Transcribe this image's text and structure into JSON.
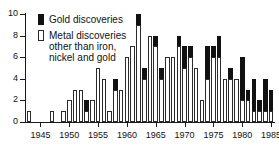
{
  "legend": {
    "gold_label": "Gold discoveries",
    "metal_label": "Metal discoveries\nother than iron,\nnickel and gold"
  },
  "axis": {
    "y_ticks": [
      "0",
      "2",
      "4",
      "6",
      "8",
      "10"
    ],
    "x_ticks": [
      "1945",
      "1950",
      "1955",
      "1960",
      "1965",
      "1970",
      "1975",
      "1980",
      "1985"
    ]
  },
  "colors": {
    "gold": "#111111",
    "metal": "#ffffff",
    "outline": "#2b2b2b",
    "axis": "#1a1a1a",
    "background": "#ffffff"
  },
  "chart_data": {
    "type": "bar",
    "title": "",
    "xlabel": "",
    "ylabel": "",
    "stacked": true,
    "grid": false,
    "legend_position": "top-left",
    "ylim": [
      0,
      10
    ],
    "xlim": [
      1942.5,
      1985.5
    ],
    "categories": [
      1943,
      1944,
      1945,
      1946,
      1947,
      1948,
      1949,
      1950,
      1951,
      1952,
      1953,
      1954,
      1955,
      1956,
      1957,
      1958,
      1959,
      1960,
      1961,
      1962,
      1963,
      1964,
      1965,
      1966,
      1967,
      1968,
      1969,
      1970,
      1971,
      1972,
      1973,
      1974,
      1975,
      1976,
      1977,
      1978,
      1979,
      1980,
      1981,
      1982,
      1983,
      1984,
      1985
    ],
    "series": [
      {
        "name": "Metal discoveries other than iron, nickel and gold",
        "values": [
          1,
          0,
          0,
          0,
          1,
          0,
          1,
          2,
          3,
          3,
          1,
          2,
          5,
          4,
          1,
          3,
          3,
          6,
          7,
          9,
          4,
          8,
          7,
          4,
          6,
          6,
          7,
          5,
          6,
          5,
          2,
          4,
          6,
          6,
          4,
          4,
          4,
          2,
          2,
          1,
          1,
          1,
          1
        ]
      },
      {
        "name": "Gold discoveries",
        "values": [
          0,
          0,
          0,
          0,
          0,
          0,
          0,
          0,
          0,
          0,
          1,
          0,
          0,
          0,
          0,
          1,
          0,
          0,
          0,
          1,
          1,
          0,
          1,
          1,
          0,
          0,
          1,
          2,
          1,
          0,
          0,
          3,
          1,
          2,
          0,
          1,
          0,
          4,
          1,
          3,
          1,
          3,
          2
        ]
      }
    ],
    "totals": [
      1,
      0,
      0,
      0,
      1,
      0,
      1,
      2,
      3,
      3,
      2,
      2,
      5,
      4,
      1,
      4,
      3,
      6,
      7,
      10,
      5,
      8,
      8,
      5,
      6,
      6,
      8,
      7,
      7,
      5,
      2,
      7,
      7,
      8,
      4,
      5,
      4,
      6,
      3,
      4,
      2,
      4,
      3
    ]
  }
}
